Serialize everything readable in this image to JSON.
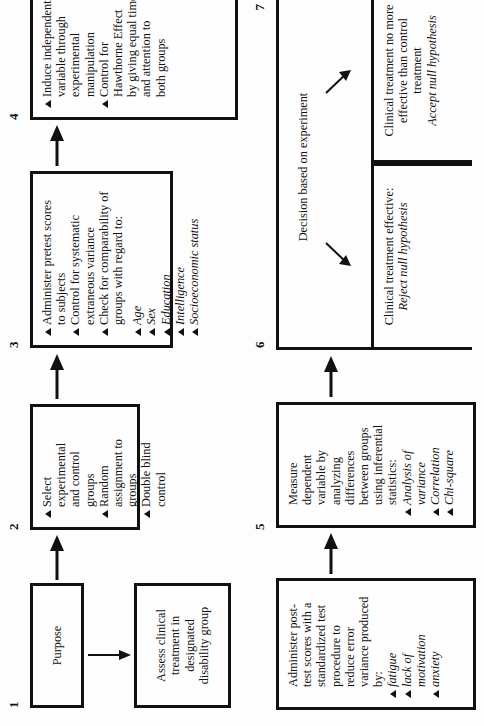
{
  "diagram": {
    "title_absent": true,
    "orientation": "rotated-90-ccw",
    "colors": {
      "ink": "#111111",
      "paper": "#ffffff"
    },
    "numbers": {
      "one": "1",
      "two": "2",
      "three": "3",
      "four": "4",
      "five": "5",
      "six": "6",
      "seven": "7"
    },
    "boxes": {
      "purpose": {
        "number": "1",
        "label": "Purpose"
      },
      "assess": {
        "lines": [
          "Assess clinical",
          "treatment in",
          "designated",
          "disability group"
        ]
      },
      "step2": {
        "number": "2",
        "items": [
          {
            "bullet": true,
            "lines": [
              "Select",
              "experimental",
              "and control",
              "groups"
            ]
          },
          {
            "bullet": true,
            "lines": [
              "Random",
              "assignment to",
              "groups"
            ]
          },
          {
            "bullet": true,
            "lines": [
              "Double blind",
              "control"
            ]
          }
        ]
      },
      "step3": {
        "number": "3",
        "items": [
          {
            "bullet": true,
            "lines": [
              "Administer pretest scores",
              "to subjects"
            ]
          },
          {
            "bullet": true,
            "lines": [
              "Control for systematic",
              "extraneous variance"
            ]
          },
          {
            "bullet": true,
            "lines": [
              "Check for comparability of",
              "groups with regard to:"
            ]
          }
        ],
        "sub_items": [
          "Age",
          "Sex",
          "Education",
          "Intelligence",
          "Socioeconomic status"
        ]
      },
      "step4": {
        "number": "4",
        "items": [
          {
            "bullet": true,
            "lines": [
              "Induce independent",
              "variable through",
              "experimental",
              "manipulation"
            ]
          },
          {
            "bullet": true,
            "lines": [
              "Control for",
              "Hawthorne Effect",
              "by giving equal time",
              "and attention to",
              "both groups"
            ]
          }
        ]
      },
      "step5": {
        "number": "5",
        "items": [
          {
            "bullet": false,
            "lines": [
              "Administer post-",
              "test scores with a",
              "standardized test",
              "procedure to",
              "reduce error",
              "variance produced",
              "by:"
            ]
          }
        ],
        "sub_items": [
          "fatigue",
          "lack of",
          "motivation",
          "anxiety"
        ]
      },
      "step6": {
        "number": "6",
        "items": [
          {
            "bullet": false,
            "lines": [
              "Measure",
              "dependent",
              "variable by",
              "analyzing",
              "differences",
              "between groups",
              "using inferential",
              "statistics:"
            ]
          }
        ],
        "sub_items": [
          "Analysis of",
          "variance",
          "Correlation",
          "Chi-square"
        ]
      },
      "step7": {
        "number": "7",
        "heading": "Decision based on experiment",
        "branch_left": {
          "lines": [
            "Clinical treatment effective:"
          ],
          "emphasis": "Reject null hypothesis"
        },
        "branch_right": {
          "lines": [
            "Clinical treatment no more",
            "effective than control",
            "treatment"
          ],
          "emphasis": "Accept null hypothesis"
        }
      }
    },
    "arrows": {
      "purpose_to_assess": "right-arrow",
      "purpose_to_step2": "up-arrow",
      "step2_to_step3": "up-arrow",
      "step3_to_step4": "up-arrow",
      "step5_to_step6": "up-arrow",
      "step6_to_step7": "up-arrow",
      "decision_left": "diagonal-arrow",
      "decision_right": "diagonal-arrow"
    }
  }
}
